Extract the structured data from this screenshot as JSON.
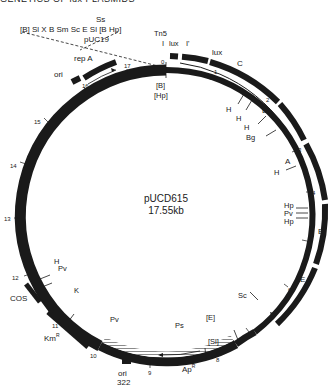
{
  "header": {
    "title": "GENETICS OF lux PLASMIDS"
  },
  "plasmid": {
    "name": "pUCD615",
    "size": "17.55kb"
  },
  "polylinker": {
    "sites_top": "Ss",
    "sites": "[B] Sl X B Sm Sc E Sl [B Hp]",
    "vector": "pUC19"
  },
  "tn5": {
    "label": "Tn5",
    "I_left": "I",
    "lux_I": "lux",
    "I_prime": "I'"
  },
  "genes": {
    "lux": "lux",
    "C": "C",
    "D": "D",
    "A": "A",
    "B": "B",
    "E": "E",
    "repA": "rep A",
    "ori": "ori",
    "cos": "COS",
    "kmR": "Km",
    "kmR_sup": "R",
    "apR": "Ap",
    "apR_sup": "R",
    "ori322_a": "ori",
    "ori322_b": "322"
  },
  "site_labels": {
    "B0": "[B]",
    "Hp0": "[Hp]",
    "H1": "H",
    "H2": "H",
    "Bg": "Bg",
    "H3": "H",
    "Hp4a": "Hp",
    "Pv4": "Pv",
    "Hp4b": "Hp",
    "Sc": "Sc",
    "E8": "[E]",
    "Sl8": "[Sl]",
    "Ps": "Ps",
    "Pv10": "Pv",
    "K": "K",
    "H12": "H",
    "Pv12": "Pv"
  },
  "scale_ticks": [
    "0",
    "1",
    "2",
    "3",
    "4",
    "5",
    "6",
    "7",
    "8",
    "9",
    "10",
    "11",
    "12",
    "13",
    "14",
    "15",
    "16",
    "17"
  ],
  "colors": {
    "ink": "#1a1a1a",
    "background": "#ffffff",
    "hatch": "#9a9a9a"
  }
}
